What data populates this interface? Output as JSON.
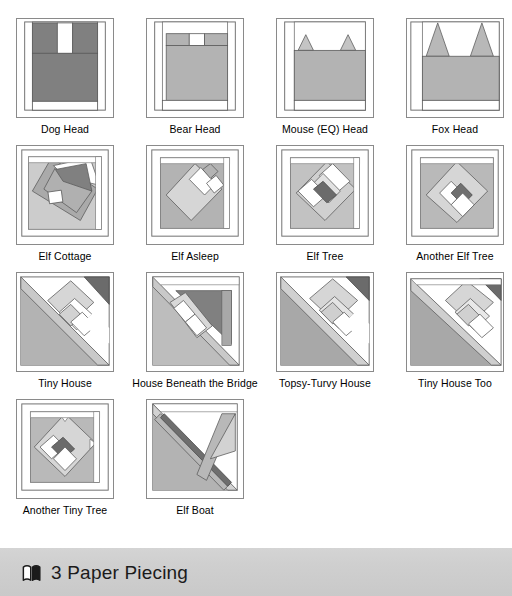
{
  "page": {
    "background": "#ffffff",
    "banner_background": "#cfcfcf"
  },
  "palette": {
    "outline": "#6e6e6e",
    "white": "#ffffff",
    "light": "#d8d8d8",
    "mid": "#b3b3b3",
    "mid2": "#9e9e9e",
    "dark": "#808080",
    "darker": "#6b6b6b",
    "verydark": "#5a5a5a"
  },
  "blocks": [
    {
      "id": "dog-head",
      "label": "Dog Head"
    },
    {
      "id": "bear-head",
      "label": "Bear Head"
    },
    {
      "id": "mouse-eq-head",
      "label": "Mouse (EQ) Head"
    },
    {
      "id": "fox-head",
      "label": "Fox Head"
    },
    {
      "id": "elf-cottage",
      "label": "Elf Cottage"
    },
    {
      "id": "elf-asleep",
      "label": "Elf Asleep"
    },
    {
      "id": "elf-tree",
      "label": "Elf Tree"
    },
    {
      "id": "another-elf-tree",
      "label": "Another Elf Tree"
    },
    {
      "id": "tiny-house",
      "label": "Tiny House"
    },
    {
      "id": "house-beneath-the-bridge",
      "label": "House Beneath the Bridge"
    },
    {
      "id": "topsy-turvy-house",
      "label": "Topsy-Turvy House"
    },
    {
      "id": "tiny-house-too",
      "label": "Tiny House Too"
    },
    {
      "id": "another-tiny-tree",
      "label": "Another Tiny Tree"
    },
    {
      "id": "elf-boat",
      "label": "Elf Boat"
    }
  ],
  "rows": [
    {
      "labels": [
        "Dog Head",
        "Bear Head",
        "Mouse (EQ) Head",
        "Fox Head"
      ]
    },
    {
      "labels": [
        "Elf Cottage",
        "Elf Asleep",
        "Elf Tree",
        "Another Elf Tree"
      ]
    },
    {
      "labels": [
        "Tiny House",
        "House Beneath the Bridge",
        "Topsy-Turvy House",
        "Tiny House Too"
      ]
    },
    {
      "labels": [
        "Another Tiny Tree",
        "Elf Boat",
        "",
        ""
      ]
    }
  ],
  "banner": {
    "icon": "open-book-icon",
    "section_number": "3",
    "title": "3 Paper Piecing"
  }
}
